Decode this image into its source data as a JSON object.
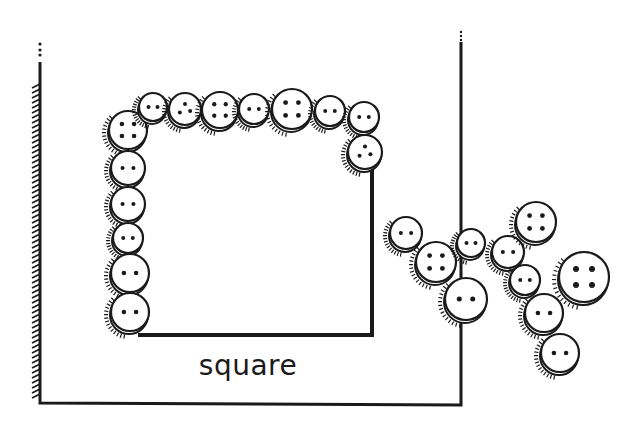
{
  "figure": {
    "label": "square",
    "colors": {
      "ink": "#1a1a1a",
      "background": "#ffffff"
    },
    "outer_frame": {
      "left_x": 40,
      "right_x": 461,
      "top_y": 48,
      "bottom_y": 403,
      "left_wall_hatched": true
    },
    "inner_square": {
      "left_x": 128,
      "right_x": 372,
      "top_y": 110,
      "bottom_y": 335
    },
    "buttons_in_square": [
      {
        "x": 128,
        "y": 130,
        "r": 19,
        "holes": 4
      },
      {
        "x": 153,
        "y": 107,
        "r": 14,
        "holes": 2
      },
      {
        "x": 185,
        "y": 109,
        "r": 16,
        "holes": 3
      },
      {
        "x": 220,
        "y": 110,
        "r": 18,
        "holes": 4
      },
      {
        "x": 254,
        "y": 109,
        "r": 15,
        "holes": 2
      },
      {
        "x": 292,
        "y": 109,
        "r": 20,
        "holes": 4
      },
      {
        "x": 330,
        "y": 111,
        "r": 15,
        "holes": 2
      },
      {
        "x": 364,
        "y": 117,
        "r": 15,
        "holes": 2
      },
      {
        "x": 365,
        "y": 152,
        "r": 17,
        "holes": 3
      },
      {
        "x": 128,
        "y": 168,
        "r": 17,
        "holes": 2
      },
      {
        "x": 128,
        "y": 204,
        "r": 17,
        "holes": 2
      },
      {
        "x": 128,
        "y": 238,
        "r": 15,
        "holes": 2
      },
      {
        "x": 130,
        "y": 273,
        "r": 19,
        "holes": 2
      },
      {
        "x": 130,
        "y": 312,
        "r": 19,
        "holes": 2
      }
    ],
    "loose_buttons": [
      {
        "x": 406,
        "y": 233,
        "r": 16,
        "holes": 2
      },
      {
        "x": 436,
        "y": 262,
        "r": 20,
        "holes": 4
      },
      {
        "x": 471,
        "y": 243,
        "r": 14,
        "holes": 2
      },
      {
        "x": 466,
        "y": 299,
        "r": 21,
        "holes": 2
      },
      {
        "x": 508,
        "y": 252,
        "r": 16,
        "holes": 2
      },
      {
        "x": 536,
        "y": 222,
        "r": 20,
        "holes": 4
      },
      {
        "x": 525,
        "y": 280,
        "r": 15,
        "holes": 2
      },
      {
        "x": 584,
        "y": 277,
        "r": 25,
        "holes": 4
      },
      {
        "x": 544,
        "y": 313,
        "r": 19,
        "holes": 2
      },
      {
        "x": 560,
        "y": 353,
        "r": 19,
        "holes": 2
      }
    ]
  }
}
